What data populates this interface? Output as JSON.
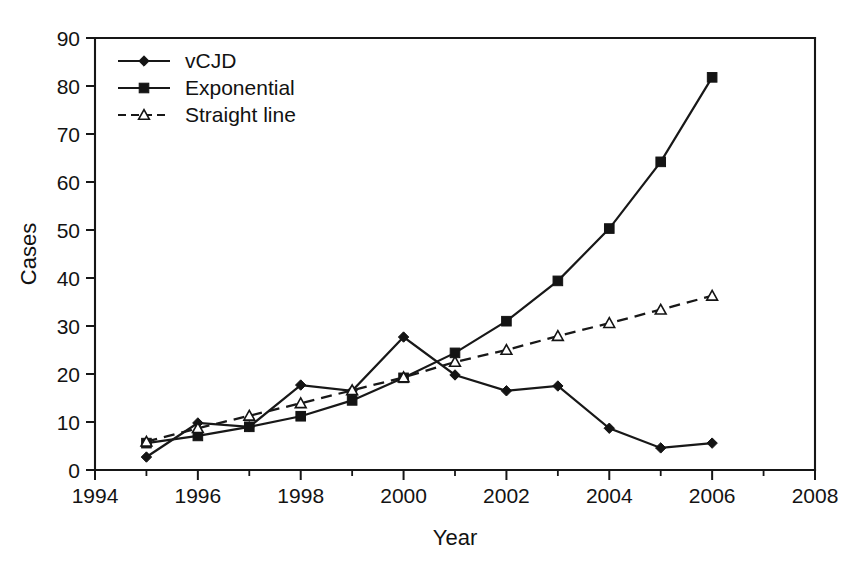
{
  "chart_data": {
    "type": "line",
    "title": "",
    "xlabel": "Year",
    "ylabel": "Cases",
    "xlim": [
      1994,
      2008
    ],
    "ylim": [
      0,
      90
    ],
    "xticks": [
      1994,
      1996,
      1998,
      2000,
      2002,
      2004,
      2006,
      2008
    ],
    "xtick_labels": [
      "1994",
      "1996",
      "1998",
      "2000",
      "2002",
      "2004",
      "2006",
      "2008"
    ],
    "xminor_ticks": [
      1995,
      1997,
      1999,
      2001,
      2003,
      2005,
      2007
    ],
    "yticks": [
      0,
      10,
      20,
      30,
      40,
      50,
      60,
      70,
      80,
      90
    ],
    "ytick_labels": [
      "0",
      "10",
      "20",
      "30",
      "40",
      "50",
      "60",
      "70",
      "80",
      "90"
    ],
    "grid": false,
    "legend_position": "upper-left-inside",
    "x": [
      1995,
      1996,
      1997,
      1998,
      1999,
      2000,
      2001,
      2002,
      2003,
      2004,
      2005,
      2006
    ],
    "series": [
      {
        "name": "vCJD",
        "marker": "diamond",
        "marker_fill": "solid",
        "linestyle": "solid",
        "values": [
          2.7,
          9.8,
          9.0,
          17.7,
          16.5,
          27.7,
          19.8,
          16.5,
          17.5,
          8.7,
          4.6,
          5.6
        ]
      },
      {
        "name": "Exponential",
        "marker": "square",
        "marker_fill": "solid",
        "linestyle": "solid",
        "values": [
          5.6,
          7.1,
          9.0,
          11.2,
          14.5,
          19.2,
          24.4,
          31.0,
          39.4,
          50.3,
          64.2,
          81.8
        ]
      },
      {
        "name": "Straight line",
        "marker": "triangle",
        "marker_fill": "open",
        "linestyle": "dashed",
        "values": [
          5.9,
          8.7,
          11.3,
          13.9,
          16.6,
          19.3,
          22.5,
          25.0,
          27.9,
          30.6,
          33.4,
          36.3
        ]
      }
    ],
    "colors": {
      "line": "#181818",
      "text": "#121212",
      "axis": "#161616",
      "background": "#ffffff"
    }
  },
  "legend": {
    "entries": [
      {
        "label": "vCJD"
      },
      {
        "label": "Exponential"
      },
      {
        "label": "Straight line"
      }
    ]
  }
}
